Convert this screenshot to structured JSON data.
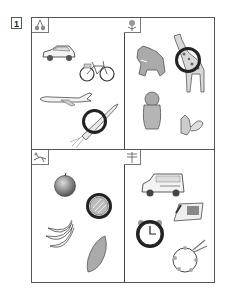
{
  "worksheet": {
    "question_number": "1",
    "quadrants": [
      {
        "category_icon": "cherries-icon",
        "items": [
          {
            "name": "car",
            "circled": false
          },
          {
            "name": "bicycle",
            "circled": false
          },
          {
            "name": "airplane",
            "circled": false
          },
          {
            "name": "rocket",
            "circled": true
          }
        ]
      },
      {
        "category_icon": "tulip-icon",
        "items": [
          {
            "name": "bear",
            "circled": false
          },
          {
            "name": "giraffe",
            "circled": true
          },
          {
            "name": "monkey",
            "circled": false
          },
          {
            "name": "squirrel",
            "circled": false
          }
        ]
      },
      {
        "category_icon": "grasshopper-icon",
        "items": [
          {
            "name": "apple",
            "circled": false
          },
          {
            "name": "melon",
            "circled": true
          },
          {
            "name": "bananas",
            "circled": false
          },
          {
            "name": "sweet-potato",
            "circled": false
          }
        ]
      },
      {
        "category_icon": "dragonfly-icon",
        "items": [
          {
            "name": "ambulance",
            "circled": false
          },
          {
            "name": "telephone",
            "circled": false
          },
          {
            "name": "alarm-clock",
            "circled": true
          },
          {
            "name": "tambourine",
            "circled": false
          }
        ]
      }
    ],
    "colors": {
      "line": "#444444",
      "mark": "#222222",
      "fill": "#b0b0b0"
    }
  }
}
